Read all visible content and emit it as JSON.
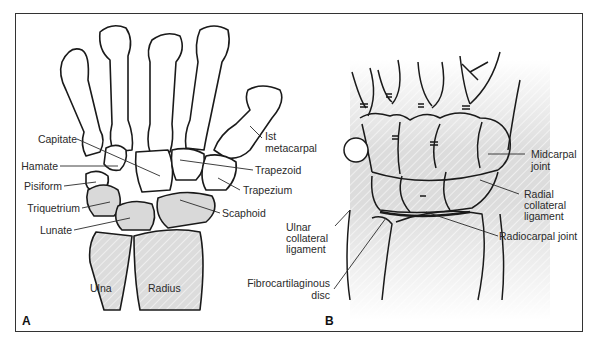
{
  "figure": {
    "panels": [
      {
        "letter": "A",
        "description": "Dorsal view of wrist and hand bones",
        "labels": {
          "capitate": "Capitate",
          "hamate": "Hamate",
          "pisiform": "Pisiform",
          "triquetrium": "Triquetrium",
          "lunate": "Lunate",
          "first_metacarpal_1": "Ist",
          "first_metacarpal_2": "metacarpal",
          "trapezoid": "Trapezoid",
          "trapezium": "Trapezium",
          "scaphoid": "Scaphoid",
          "ulna": "Ulna",
          "radius": "Radius"
        }
      },
      {
        "letter": "B",
        "description": "Coronal section of wrist joints and ligaments",
        "labels": {
          "midcarpal_1": "Midcarpal",
          "midcarpal_2": "joint",
          "radial_collateral_1": "Radial",
          "radial_collateral_2": "collateral",
          "radial_collateral_3": "ligament",
          "ulnar_collateral_1": "Ulnar",
          "ulnar_collateral_2": "collateral",
          "ulnar_collateral_3": "ligament",
          "radiocarpal": "Radiocarpal joint",
          "fibrocartilaginous_1": "Fibrocartilaginous",
          "fibrocartilaginous_2": "disc"
        }
      }
    ],
    "colors": {
      "line": "#1a1a1a",
      "bone_fill": "#ffffff",
      "shade": "#d9d9d9",
      "frame": "#333333"
    }
  }
}
